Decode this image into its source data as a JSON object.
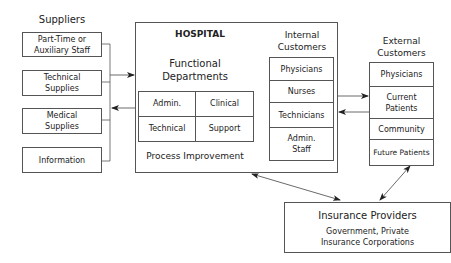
{
  "suppliers": {
    "title": "Suppliers",
    "items": [
      {
        "label": "Part-Time or Auxiliary Staff",
        "line1": "Part-Time or",
        "line2": "Auxiliary Staff"
      },
      {
        "label": "Technical Supplies",
        "line1": "Technical",
        "line2": "Supplies"
      },
      {
        "label": "Medical Supplies",
        "line1": "Medical",
        "line2": "Supplies"
      },
      {
        "label": "Information",
        "line1": "Information",
        "line2": ""
      }
    ]
  },
  "hospital": {
    "title": "HOSPITAL",
    "functional_departments": {
      "title_line1": "Functional",
      "title_line2": "Departments",
      "cells": [
        "Admin.",
        "Clinical",
        "Technical",
        "Support"
      ]
    },
    "process_improvement": "Process Improvement",
    "internal_customers": {
      "title_line1": "Internal",
      "title_line2": "Customers",
      "items": [
        {
          "line1": "Physicians",
          "line2": ""
        },
        {
          "line1": "Nurses",
          "line2": ""
        },
        {
          "line1": "Technicians",
          "line2": ""
        },
        {
          "line1": "Admin.",
          "line2": "Staff"
        }
      ]
    }
  },
  "external_customers": {
    "title_line1": "External",
    "title_line2": "Customers",
    "items": [
      {
        "line1": "Physicians",
        "line2": ""
      },
      {
        "line1": "Current",
        "line2": "Patients"
      },
      {
        "line1": "Community",
        "line2": ""
      },
      {
        "line1": "Future Patients",
        "line2": ""
      }
    ]
  },
  "insurance": {
    "title": "Insurance Providers",
    "subtitle_line1": "Government, Private",
    "subtitle_line2": "Insurance Corporations"
  },
  "colors": {
    "line": "#444444",
    "border": "#555555",
    "text": "#222222",
    "background": "#ffffff"
  }
}
